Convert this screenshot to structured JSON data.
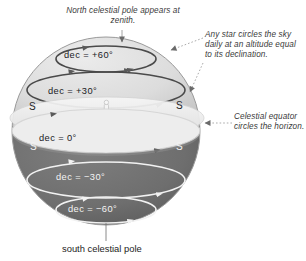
{
  "figure": {
    "sphere": {
      "upper_hemisphere_color": "#dcdcdc",
      "lower_hemisphere_color": "#6e6e6e",
      "horizon_plane_color": "#efefef",
      "outline_color": "#8d8d8d"
    }
  },
  "annotations": {
    "north_pole": "North celestial pole appears at zenith.",
    "star_circles": "Any star circles the sky daily at an altitude equal to its declination.",
    "celestial_equator": "Celestial equator circles the horizon."
  },
  "caption": {
    "south_pole": "south celestial pole"
  },
  "declination_circles": [
    {
      "label": "dec = +60°",
      "value": 60,
      "stroke": "#4a4a4a",
      "text_color": "#20201f"
    },
    {
      "label": "dec = +30°",
      "value": 30,
      "stroke": "#4a4a4a",
      "text_color": "#20201f"
    },
    {
      "label": "dec = 0°",
      "value": 0,
      "stroke": "#d8d8d8",
      "text_color": "#20201f"
    },
    {
      "label": "dec = −30°",
      "value": -30,
      "stroke": "#f2f2f2",
      "text_color": "#f4f4f4"
    },
    {
      "label": "dec = −60°",
      "value": -60,
      "stroke": "#f2f2f2",
      "text_color": "#f4f4f4"
    }
  ],
  "horizon_markers": {
    "label": "S",
    "positions": [
      "upper-left",
      "upper-right",
      "lower-left",
      "lower-right"
    ]
  },
  "observer": {
    "name": "observer figure at center of horizon"
  }
}
